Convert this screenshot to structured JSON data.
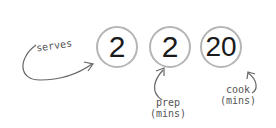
{
  "stats": [
    {
      "value": "2",
      "label": "serves"
    },
    {
      "value": "2",
      "label": "prep",
      "sub": "(mins)"
    },
    {
      "value": "20",
      "label": "cook",
      "sub": "(mins)"
    }
  ]
}
